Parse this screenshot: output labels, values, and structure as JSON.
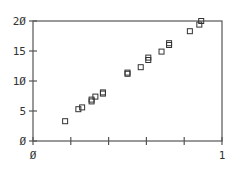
{
  "chart_data": {
    "type": "scatter",
    "title": "",
    "xlabel": "",
    "ylabel": "",
    "xlim": [
      0,
      1
    ],
    "ylim": [
      0,
      20
    ],
    "grid": false,
    "legend": null,
    "marker": "open-square",
    "x_ticks": [
      0,
      0.2,
      0.4,
      0.6,
      0.8,
      1
    ],
    "x_tick_labels": [
      "0",
      "",
      "",
      "",
      "",
      "1"
    ],
    "y_ticks": [
      0,
      5,
      10,
      15,
      20
    ],
    "y_tick_labels": [
      "0",
      "5",
      "10",
      "15",
      "20"
    ],
    "series": [
      {
        "name": "points",
        "x": [
          0.17,
          0.24,
          0.26,
          0.31,
          0.31,
          0.33,
          0.37,
          0.37,
          0.5,
          0.5,
          0.57,
          0.61,
          0.61,
          0.68,
          0.72,
          0.72,
          0.83,
          0.88,
          0.89
        ],
        "y": [
          3.3,
          5.3,
          5.6,
          6.6,
          6.9,
          7.4,
          7.9,
          8.1,
          11.2,
          11.4,
          12.3,
          13.5,
          13.9,
          14.9,
          16.0,
          16.3,
          18.3,
          19.4,
          20.0
        ]
      }
    ]
  },
  "colors": {
    "axis": "#555555",
    "marker": "#333333",
    "text": "#333333"
  },
  "axes": {
    "x_label_0": "Ø",
    "x_label_1": "1",
    "y_label_0": "Ø",
    "y_label_5": "5",
    "y_label_10": "1Ø",
    "y_label_15": "15",
    "y_label_20": "2Ø"
  }
}
